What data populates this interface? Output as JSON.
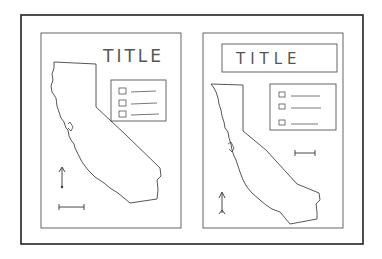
{
  "diagram": {
    "colors": {
      "ink": "#333333",
      "outer_frame": "#222222",
      "background": "#ffffff"
    },
    "panels": [
      {
        "id": "left",
        "title": "TITLE",
        "title_style": "free-floating, top right",
        "legend_items": 3,
        "elements": [
          "title",
          "map-california",
          "legend-box",
          "north-arrow",
          "scale-bar"
        ]
      },
      {
        "id": "right",
        "title": "TITLE",
        "title_style": "boxed, centered at top",
        "legend_items": 3,
        "elements": [
          "title-box",
          "map-california",
          "legend-box",
          "scale-bar",
          "north-arrow"
        ]
      }
    ]
  }
}
